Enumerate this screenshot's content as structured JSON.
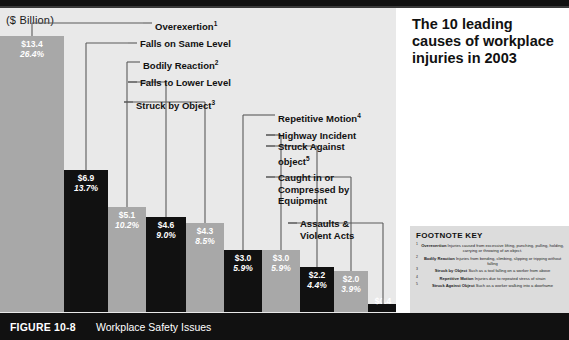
{
  "figure": {
    "number_label": "FIGURE 10-8",
    "caption": "Workplace Safety Issues",
    "title": "The 10 leading causes of workplace injuries in 2003",
    "axis_title": "($ Billion)"
  },
  "footnote_key": {
    "heading": "FOOTNOTE KEY",
    "items": [
      {
        "num": "1",
        "term": "Overexertion",
        "text": "Injuries caused from excessive lifting, punching, pulling, holding, carrying or throwing of an object."
      },
      {
        "num": "2",
        "term": "Bodily Reaction",
        "text": "Injuries from bending, climbing, slipping or tripping without falling"
      },
      {
        "num": "3",
        "term": "Struck by Object",
        "text": "Such as a tool falling on a worker from above"
      },
      {
        "num": "4",
        "term": "Repetitive Motion",
        "text": "Injuries due to repeated stress of strain"
      },
      {
        "num": "5",
        "term": "Struck Against Object",
        "text": "Such as a worker walking into a doorframe"
      }
    ]
  },
  "callouts": [
    {
      "label": "Overexertion",
      "sup": "1"
    },
    {
      "label": "Falls on Same Level",
      "sup": ""
    },
    {
      "label": "Bodily Reaction",
      "sup": "2"
    },
    {
      "label": "Falls to Lower Level",
      "sup": ""
    },
    {
      "label": "Struck by Object",
      "sup": "3"
    },
    {
      "label": "Repetitive Motion",
      "sup": "4"
    },
    {
      "label": "Highway Incident",
      "sup": ""
    },
    {
      "label": "Struck Against object",
      "sup": "5"
    },
    {
      "label": "Caught in or Compressed by Equipment",
      "sup": ""
    },
    {
      "label": "Assaults & Violent Acts",
      "sup": ""
    }
  ],
  "chart_data": {
    "type": "bar",
    "title": "The 10 leading causes of workplace injuries in 2003",
    "xlabel": "",
    "ylabel": "($ Billion)",
    "ylim": [
      0,
      13.4
    ],
    "grid": false,
    "legend": "none",
    "categories": [
      "Overexertion",
      "Falls on Same Level",
      "Bodily Reaction",
      "Falls to Lower Level",
      "Struck by Object",
      "Repetitive Motion",
      "Highway Incident",
      "Struck Against object",
      "Caught in or Compressed by Equipment",
      "Assaults & Violent Acts"
    ],
    "values": [
      13.4,
      6.9,
      5.1,
      4.6,
      4.3,
      3.0,
      3.0,
      2.2,
      2.0,
      0.4
    ],
    "value_labels": [
      "$13.4",
      "$6.9",
      "$5.1",
      "$4.6",
      "$4.3",
      "$3.0",
      "$3.0",
      "$2.2",
      "$2.0",
      "$0.4"
    ],
    "percent_labels": [
      "26.4%",
      "13.7%",
      "10.2%",
      "9.0%",
      "8.5%",
      "5.9%",
      "5.9%",
      "4.4%",
      "3.9%",
      "0.8%"
    ],
    "percents": [
      26.4,
      13.7,
      10.2,
      9.0,
      8.5,
      5.9,
      5.9,
      4.4,
      3.9,
      0.8
    ],
    "bar_colors": [
      "#a8a8a8",
      "#111111",
      "#a8a8a8",
      "#111111",
      "#a8a8a8",
      "#111111",
      "#a8a8a8",
      "#111111",
      "#a8a8a8",
      "#111111"
    ],
    "background": "#e9e9e9"
  }
}
